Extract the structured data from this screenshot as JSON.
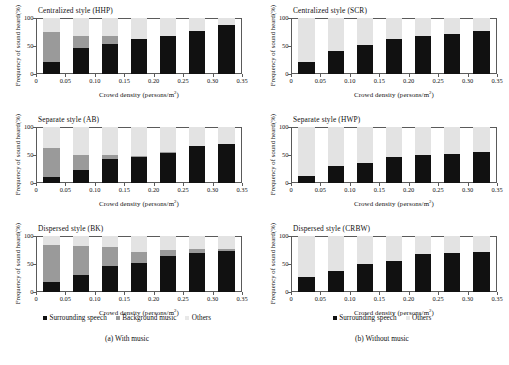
{
  "figure": {
    "width": 509,
    "height": 365,
    "axis_labels": {
      "y": "Frequency of sound heard(%)",
      "x_prefix": "Crowd density (persons/m",
      "x_suffix": ")",
      "x_exponent": "2"
    },
    "y_ticks": [
      "100",
      "50",
      "0"
    ],
    "x_ticks": [
      "0",
      "0.05",
      "0.10",
      "0.15",
      "0.20",
      "0.25",
      "0.30",
      "0.35"
    ],
    "colors": {
      "surrounding_speech": "#111111",
      "background_music": "#9a9a9a",
      "others": "#e3e3e3",
      "axis": "#5a5a5a",
      "text": "#111111"
    }
  },
  "legends": {
    "left": [
      {
        "label": "Surrounding speech",
        "swatch": "speech"
      },
      {
        "label": "Background music",
        "swatch": "music"
      },
      {
        "label": "Others",
        "swatch": "others"
      }
    ],
    "right": [
      {
        "label": "Surrounding speech",
        "swatch": "speech"
      },
      {
        "label": "Others",
        "swatch": "others"
      }
    ]
  },
  "captions": {
    "left": "(a) With music",
    "right": "(b) Without music"
  },
  "chart_data": [
    {
      "id": "hhp",
      "type": "bar",
      "stacked": true,
      "title": "Centralized style (HHP)",
      "column": "left",
      "row": 0,
      "xlabel": "Crowd density (persons/m2)",
      "ylabel": "Frequency of sound heard(%)",
      "ylim": [
        0,
        100
      ],
      "xlim": [
        0,
        0.35
      ],
      "grid": false,
      "legend_position": "bottom",
      "categories": [
        0.025,
        0.075,
        0.125,
        0.175,
        0.225,
        0.275,
        0.325
      ],
      "series": [
        {
          "name": "Surrounding speech",
          "values": [
            21,
            47,
            54,
            63,
            68,
            77,
            88
          ]
        },
        {
          "name": "Background music",
          "values": [
            54,
            21,
            14,
            0,
            0,
            0,
            0
          ]
        },
        {
          "name": "Others",
          "values": [
            25,
            32,
            32,
            37,
            32,
            23,
            12
          ]
        }
      ]
    },
    {
      "id": "scr",
      "type": "bar",
      "stacked": true,
      "title": "Centralized style (SCR)",
      "column": "right",
      "row": 0,
      "xlabel": "Crowd density (persons/m2)",
      "ylabel": "Frequency of sound heard(%)",
      "ylim": [
        0,
        100
      ],
      "xlim": [
        0,
        0.35
      ],
      "grid": false,
      "legend_position": "bottom",
      "categories": [
        0.025,
        0.075,
        0.125,
        0.175,
        0.225,
        0.275,
        0.325
      ],
      "series": [
        {
          "name": "Surrounding speech",
          "values": [
            22,
            41,
            52,
            62,
            67,
            71,
            76
          ]
        },
        {
          "name": "Others",
          "values": [
            78,
            59,
            48,
            38,
            33,
            29,
            24
          ]
        }
      ]
    },
    {
      "id": "ab",
      "type": "bar",
      "stacked": true,
      "title": "Separate style (AB)",
      "column": "left",
      "row": 1,
      "xlabel": "Crowd density (persons/m2)",
      "ylabel": "Frequency of sound heard(%)",
      "ylim": [
        0,
        100
      ],
      "xlim": [
        0,
        0.35
      ],
      "grid": false,
      "legend_position": "bottom",
      "categories": [
        0.025,
        0.075,
        0.125,
        0.175,
        0.225,
        0.275,
        0.325
      ],
      "series": [
        {
          "name": "Surrounding speech",
          "values": [
            10,
            23,
            42,
            47,
            53,
            66,
            69
          ]
        },
        {
          "name": "Background music",
          "values": [
            53,
            27,
            8,
            1,
            2,
            0,
            0
          ]
        },
        {
          "name": "Others",
          "values": [
            37,
            50,
            50,
            52,
            45,
            34,
            31
          ]
        }
      ]
    },
    {
      "id": "hwp",
      "type": "bar",
      "stacked": true,
      "title": "Separate style (HWP)",
      "column": "right",
      "row": 1,
      "xlabel": "Crowd density (persons/m2)",
      "ylabel": "Frequency of sound heard(%)",
      "ylim": [
        0,
        100
      ],
      "xlim": [
        0,
        0.35
      ],
      "grid": false,
      "legend_position": "bottom",
      "categories": [
        0.025,
        0.075,
        0.125,
        0.175,
        0.225,
        0.275,
        0.325
      ],
      "series": [
        {
          "name": "Surrounding speech",
          "values": [
            13,
            30,
            35,
            46,
            50,
            52,
            56
          ]
        },
        {
          "name": "Others",
          "values": [
            87,
            70,
            65,
            54,
            50,
            48,
            44
          ]
        }
      ]
    },
    {
      "id": "bk",
      "type": "bar",
      "stacked": true,
      "title": "Dispersed style (BK)",
      "column": "left",
      "row": 2,
      "xlabel": "Crowd density (persons/m2)",
      "ylabel": "Frequency of sound heard(%)",
      "ylim": [
        0,
        100
      ],
      "xlim": [
        0,
        0.35
      ],
      "grid": false,
      "legend_position": "bottom",
      "categories": [
        0.025,
        0.075,
        0.125,
        0.175,
        0.225,
        0.275,
        0.325
      ],
      "series": [
        {
          "name": "Surrounding speech",
          "values": [
            17,
            31,
            47,
            51,
            65,
            70,
            73
          ]
        },
        {
          "name": "Background music",
          "values": [
            67,
            52,
            33,
            20,
            10,
            6,
            4
          ]
        },
        {
          "name": "Others",
          "values": [
            16,
            17,
            20,
            29,
            25,
            24,
            23
          ]
        }
      ]
    },
    {
      "id": "crbw",
      "type": "bar",
      "stacked": true,
      "title": "Dispersed style (CRBW)",
      "column": "right",
      "row": 2,
      "xlabel": "Crowd density (persons/m2)",
      "ylabel": "Frequency of sound heard(%)",
      "ylim": [
        0,
        100
      ],
      "xlim": [
        0,
        0.35
      ],
      "grid": false,
      "legend_position": "bottom",
      "categories": [
        0.025,
        0.075,
        0.125,
        0.175,
        0.225,
        0.275,
        0.325
      ],
      "series": [
        {
          "name": "Surrounding speech",
          "values": [
            27,
            37,
            50,
            55,
            67,
            69,
            71
          ]
        },
        {
          "name": "Others",
          "values": [
            73,
            63,
            50,
            45,
            33,
            31,
            29
          ]
        }
      ]
    }
  ]
}
